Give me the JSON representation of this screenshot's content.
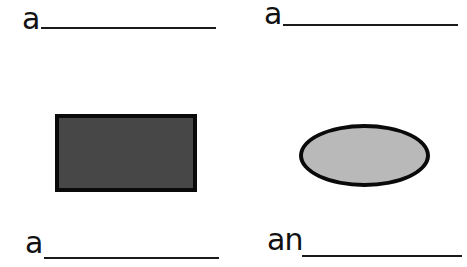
{
  "worksheet": {
    "items": [
      {
        "article": "a",
        "blank": "",
        "shape": "none"
      },
      {
        "article": "a",
        "blank": "",
        "shape": "none"
      },
      {
        "article": "a",
        "blank": "",
        "shape": "rectangle",
        "fill": "#474747"
      },
      {
        "article": "an",
        "blank": "",
        "shape": "oval",
        "fill": "#b9b9b9"
      }
    ]
  }
}
